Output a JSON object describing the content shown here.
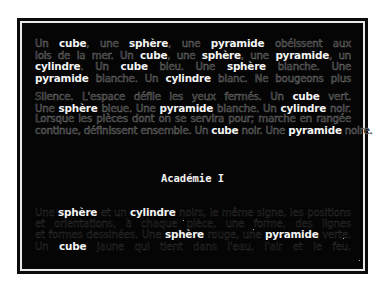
{
  "image": {
    "description": "Black screen framed in a thin white-lined border showing justified French text; keywords highlighted in bright bold white while the rest is faint outlined text",
    "title": "Académie I"
  },
  "paragraphs": [
    {
      "lines": [
        [
          {
            "t": "Un ",
            "b": false
          },
          {
            "t": "cube",
            "b": true
          },
          {
            "t": ", une ",
            "b": false
          },
          {
            "t": "sphère",
            "b": true
          },
          {
            "t": ", une ",
            "b": false
          },
          {
            "t": "pyramide",
            "b": true
          },
          {
            "t": " obéissent aux",
            "b": false
          }
        ],
        [
          {
            "t": "lois de la mer. Un ",
            "b": false
          },
          {
            "t": "cube",
            "b": true
          },
          {
            "t": ", une ",
            "b": false
          },
          {
            "t": "sphère",
            "b": true
          },
          {
            "t": ", une ",
            "b": false
          },
          {
            "t": "pyramide",
            "b": true
          },
          {
            "t": ", un",
            "b": false
          }
        ],
        [
          {
            "t": "cylindre",
            "b": true
          },
          {
            "t": ". Un ",
            "b": false
          },
          {
            "t": "cube",
            "b": true
          },
          {
            "t": " bleu. Une ",
            "b": false
          },
          {
            "t": "sphère",
            "b": true
          },
          {
            "t": " blanche. Une",
            "b": false
          }
        ],
        [
          {
            "t": "pyramide",
            "b": true
          },
          {
            "t": " blanche. Un ",
            "b": false
          },
          {
            "t": "cylindre",
            "b": true
          },
          {
            "t": " blanc. Ne bougeons plus",
            "b": false
          }
        ]
      ]
    },
    {
      "lines": [
        [
          {
            "t": "Silence. L'espace défile les yeux fermés. Un ",
            "b": false
          },
          {
            "t": "cube",
            "b": true
          },
          {
            "t": " vert.",
            "b": false
          }
        ],
        [
          {
            "t": "Une ",
            "b": false
          },
          {
            "t": "sphère",
            "b": true
          },
          {
            "t": " bleue. Une ",
            "b": false
          },
          {
            "t": "pyramide",
            "b": true
          },
          {
            "t": " blanche. Un ",
            "b": false
          },
          {
            "t": "cylindre",
            "b": true
          },
          {
            "t": " noir.",
            "b": false
          }
        ],
        [
          {
            "t": "Lorsque les pièces dont on se servira pour; marche en rangée",
            "b": false
          }
        ],
        [
          {
            "t": "continue, définissent ensemble. Un ",
            "b": false
          },
          {
            "t": "cube",
            "b": true
          },
          {
            "t": " noir. Une ",
            "b": false
          },
          {
            "t": "pyramide",
            "b": true
          },
          {
            "t": " noire.",
            "b": false
          }
        ]
      ]
    },
    {
      "lines": [
        [
          {
            "t": "Une ",
            "b": false
          },
          {
            "t": "sphère",
            "b": true
          },
          {
            "t": " et un ",
            "b": false
          },
          {
            "t": "cylindre",
            "b": true
          },
          {
            "t": " noirs, le même signe, les positions",
            "b": false
          }
        ],
        [
          {
            "t": "et orientations, à chaque pièce, une forme, des lignes",
            "b": false
          }
        ],
        [
          {
            "t": "et formes dessinées. Une ",
            "b": false
          },
          {
            "t": "sphère",
            "b": true
          },
          {
            "t": " rouge, une ",
            "b": false
          },
          {
            "t": "pyramide",
            "b": true
          },
          {
            "t": " verte.",
            "b": false
          }
        ],
        [
          {
            "t": "Un ",
            "b": false
          },
          {
            "t": "cube",
            "b": true
          },
          {
            "t": " jaune qui tient dans l'eau, l'air et le feu.",
            "b": false
          }
        ]
      ]
    }
  ],
  "colors": {
    "background": "#ffffff",
    "screen": "#050505",
    "frame_line": "#e8e8e8",
    "highlight_text": "#f4f4f4",
    "faint_text": "#6d6d6d"
  }
}
